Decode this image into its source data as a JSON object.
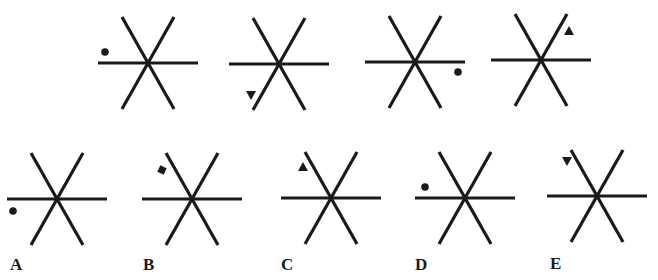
{
  "puzzle": {
    "cutoff_text": "",
    "line_color": "#1a1a1a",
    "sequence": [
      {
        "id": "seq-1",
        "cx": 148,
        "cy": 63,
        "marker": {
          "shape": "circle",
          "dx": -43,
          "dy": -11
        }
      },
      {
        "id": "seq-2",
        "cx": 279,
        "cy": 64,
        "marker": {
          "shape": "triangle-down",
          "dx": -28,
          "dy": 31
        }
      },
      {
        "id": "seq-3",
        "cx": 415,
        "cy": 62,
        "marker": {
          "shape": "circle",
          "dx": 43,
          "dy": 10
        }
      },
      {
        "id": "seq-4",
        "cx": 541,
        "cy": 60,
        "marker": {
          "shape": "triangle-up",
          "dx": 28,
          "dy": -29
        }
      }
    ],
    "options": [
      {
        "id": "A",
        "label": "A",
        "cx": 57,
        "cy": 199,
        "label_x": 10,
        "label_y": 255,
        "marker": {
          "shape": "circle",
          "dx": -44,
          "dy": 12
        }
      },
      {
        "id": "B",
        "label": "B",
        "cx": 192,
        "cy": 199,
        "label_x": 143,
        "label_y": 255,
        "marker": {
          "shape": "square",
          "dx": -30,
          "dy": -29
        }
      },
      {
        "id": "C",
        "label": "C",
        "cx": 331,
        "cy": 198,
        "label_x": 281,
        "label_y": 255,
        "marker": {
          "shape": "triangle-up",
          "dx": -28,
          "dy": -31
        }
      },
      {
        "id": "D",
        "label": "D",
        "cx": 465,
        "cy": 198,
        "label_x": 415,
        "label_y": 255,
        "marker": {
          "shape": "circle",
          "dx": -40,
          "dy": -11
        }
      },
      {
        "id": "E",
        "label": "E",
        "cx": 597,
        "cy": 196,
        "label_x": 550,
        "label_y": 254,
        "marker": {
          "shape": "triangle-down",
          "dx": -30,
          "dy": -35
        }
      }
    ]
  }
}
